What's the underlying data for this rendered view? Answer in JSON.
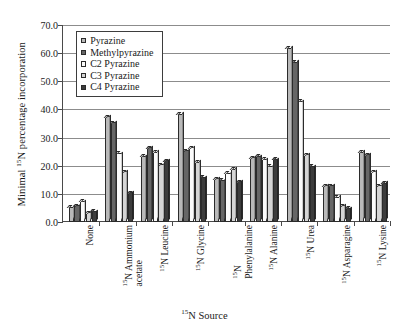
{
  "chart_data": {
    "type": "bar",
    "title": "",
    "subtitle": "",
    "xlabel": "15N Source",
    "xlabel_html": "<sup>15</sup>N Source",
    "ylabel": "Minimal 15N percentage incorporation",
    "ylabel_html": "Minimal <sup>15</sup>N percentage incorporation",
    "ylim": [
      0.0,
      70.0
    ],
    "ytick_step": 10.0,
    "ytick_labels": [
      "70.0",
      "60.0",
      "50.0",
      "40.0",
      "30.0",
      "20.0",
      "10.0",
      "0.0"
    ],
    "ytick_values": [
      70.0,
      60.0,
      50.0,
      40.0,
      30.0,
      20.0,
      10.0,
      0.0
    ],
    "grid": "horizontal",
    "legend_position": "top-left-inside",
    "categories": [
      "None",
      "15N Ammonium acetate",
      "15N Leucine",
      "15N Glycine",
      "15N Phenylalanine",
      "15N Alanine",
      "15N Urea",
      "15N Asparagine",
      "15N Lysine"
    ],
    "category_labels_html": [
      "None",
      "<sup>15</sup>N Ammonium<span class=\"l2\">acetate</span>",
      "<sup>15</sup>N Leucine",
      "<sup>15</sup>N Glycine",
      "<sup>15</sup>N<span class=\"l2\">Phenylalanine</span>",
      "<sup>15</sup>N Alanine",
      "<sup>15</sup>N Urea",
      "<sup>15</sup>N Asparagine",
      "<sup>15</sup>N Lysine"
    ],
    "series": [
      {
        "name": "Pyrazine",
        "color": "#b9b9b9",
        "values": [
          5.5,
          37.5,
          23.5,
          38.5,
          15.5,
          23.0,
          62.0,
          13.0,
          25.0
        ]
      },
      {
        "name": "Methylpyrazine",
        "color": "#666666",
        "values": [
          6.0,
          35.5,
          26.5,
          25.5,
          15.0,
          23.5,
          57.0,
          13.0,
          24.0
        ]
      },
      {
        "name": "C2 Pyrazine",
        "color": "#fbfbfb",
        "values": [
          7.5,
          24.5,
          25.0,
          26.5,
          17.5,
          22.5,
          43.0,
          9.0,
          18.0
        ]
      },
      {
        "name": "C3 Pyrazine",
        "color": "#d5d5d5",
        "values": [
          3.5,
          18.0,
          20.5,
          21.5,
          19.0,
          20.0,
          24.0,
          6.0,
          13.0
        ]
      },
      {
        "name": "C4 Pyrazine",
        "color": "#3c3c3c",
        "values": [
          4.0,
          10.5,
          22.0,
          16.0,
          14.5,
          22.5,
          20.0,
          5.0,
          14.0
        ]
      }
    ]
  },
  "legend": {
    "items": [
      {
        "label": "Pyrazine",
        "swatch": "#b9b9b9"
      },
      {
        "label": "Methylpyrazine",
        "swatch": "#666666"
      },
      {
        "label": "C2 Pyrazine",
        "swatch": "#fbfbfb"
      },
      {
        "label": "C3 Pyrazine",
        "swatch": "#d5d5d5"
      },
      {
        "label": "C4 Pyrazine",
        "swatch": "#3c3c3c"
      }
    ]
  }
}
